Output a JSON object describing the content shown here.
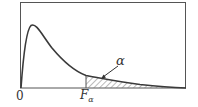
{
  "diagram": {
    "labels": {
      "origin": "0",
      "critical_value": "F",
      "critical_value_sub": "α",
      "tail_area": "α"
    },
    "colors": {
      "curve": "#3a3a3a",
      "frame": "#444444",
      "hatch": "#777777"
    }
  }
}
